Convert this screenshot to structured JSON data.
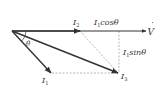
{
  "diagram": {
    "colors": {
      "vector": "#333333",
      "dashed_guide": "#9a9a9a",
      "background": "#ffffff"
    },
    "labels": {
      "v": "V",
      "v_dot": "˙",
      "i1": "I",
      "i1_sub": "1",
      "i2": "I",
      "i2_sub": "2",
      "i3": "I",
      "i3_sub": "3",
      "theta": "θ",
      "cos_component": {
        "prefix": "I",
        "sub": "1",
        "text": "cosθ"
      },
      "sin_component": {
        "prefix": "I",
        "sub": "1",
        "text": "sinθ"
      }
    },
    "vectors": [
      {
        "name": "V",
        "from": [
          12,
          31
        ],
        "to": [
          146,
          31
        ]
      },
      {
        "name": "I2",
        "from": [
          12,
          31
        ],
        "to": [
          80,
          31
        ]
      },
      {
        "name": "I1",
        "from": [
          12,
          31
        ],
        "to": [
          51,
          73
        ]
      },
      {
        "name": "I3",
        "from": [
          12,
          31
        ],
        "to": [
          118,
          73
        ]
      }
    ],
    "guides": [
      {
        "name": "I1-to-I3",
        "from": [
          52,
          73
        ],
        "to": [
          116,
          73
        ]
      },
      {
        "name": "I2-to-I3",
        "from": [
          80,
          31
        ],
        "to": [
          118,
          73
        ]
      },
      {
        "name": "sin-drop",
        "from": [
          119,
          31
        ],
        "to": [
          119,
          72
        ]
      }
    ]
  }
}
